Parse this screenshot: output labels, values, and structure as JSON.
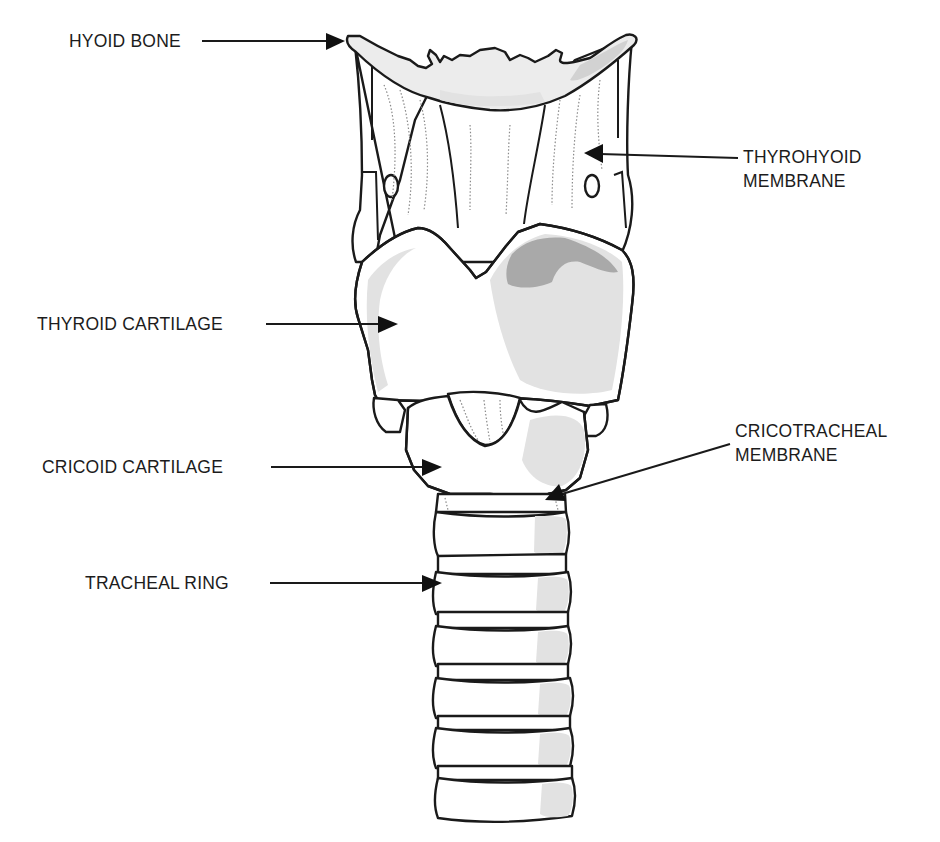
{
  "diagram": {
    "labels": {
      "hyoid_bone": "HYOID BONE",
      "thyrohyoid_membrane": [
        "THYROHYOID",
        "MEMBRANE"
      ],
      "thyroid_cartilage": "THYROID CARTILAGE",
      "cricoid_cartilage": "CRICOID CARTILAGE",
      "cricotracheal_membrane": [
        "CRICOTRACHEAL",
        "MEMBRANE"
      ],
      "tracheal_ring": "TRACHEAL RING"
    },
    "colors": {
      "line": "#1a1a1a",
      "light_shade": "#e2e2e2",
      "mid_shade": "#d2d2d2",
      "dark_shade": "#a9a9a9",
      "background": "#ffffff"
    }
  }
}
